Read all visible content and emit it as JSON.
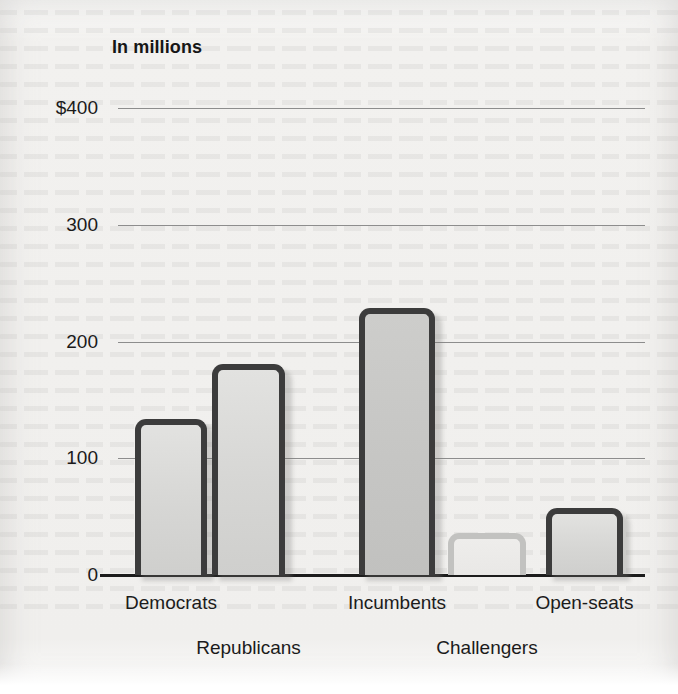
{
  "chart_data": {
    "type": "bar",
    "title": "In millions",
    "xlabel": "",
    "ylabel": "",
    "ylim": [
      0,
      400
    ],
    "grid": true,
    "legend": "none",
    "y_ticks": [
      {
        "value": 400,
        "label": "$400"
      },
      {
        "value": 300,
        "label": "300"
      },
      {
        "value": 200,
        "label": "200"
      },
      {
        "value": 100,
        "label": "100"
      },
      {
        "value": 0,
        "label": "0"
      }
    ],
    "categories": [
      "Democrats",
      "Republicans",
      "Incumbents",
      "Challengers",
      "Open-seats"
    ],
    "values": [
      134,
      181,
      229,
      36,
      57
    ],
    "bars": [
      {
        "category": "Democrats",
        "value": 134,
        "style": "outlined",
        "label_row": "top"
      },
      {
        "category": "Republicans",
        "value": 181,
        "style": "outlined",
        "label_row": "bottom"
      },
      {
        "category": "Incumbents",
        "value": 229,
        "style": "solid",
        "label_row": "top"
      },
      {
        "category": "Challengers",
        "value": 36,
        "style": "muted",
        "label_row": "bottom"
      },
      {
        "category": "Open-seats",
        "value": 57,
        "style": "outlined",
        "label_row": "top"
      }
    ],
    "colors": {
      "background": "#f1f0ee",
      "bar_outline": "#3c3c3c",
      "bar_outline_muted": "#c2c2c0",
      "bar_fill": "#d6d6d4",
      "gridline": "#8d8d8d",
      "axis": "#1c1c1c",
      "text": "#1a1a1a"
    }
  }
}
